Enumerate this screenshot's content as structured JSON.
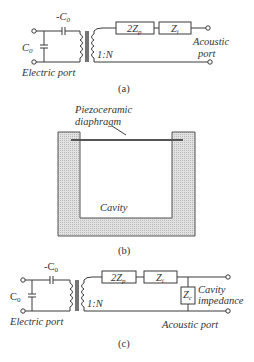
{
  "figure": {
    "panel_a": {
      "caption": "(a)",
      "series_capacitor": "-C",
      "series_capacitor_sub": "0",
      "shunt_capacitor": "C",
      "shunt_capacitor_sub": "0",
      "transformer_ratio": "1:N",
      "impedance_1": "2Z",
      "impedance_1_sub": "p",
      "impedance_2": "Z",
      "impedance_2_sub": "i",
      "electric_port_label": "Electric port",
      "acoustic_port_label_line1": "Acoustic",
      "acoustic_port_label_line2": "port"
    },
    "panel_b": {
      "caption": "(b)",
      "diaphragm_label_line1": "Piezoceramic",
      "diaphragm_label_line2": "diaphragm",
      "cavity_label": "Cavity"
    },
    "panel_c": {
      "caption": "(c)",
      "series_capacitor": "-C",
      "series_capacitor_sub": "0",
      "shunt_capacitor": "C",
      "shunt_capacitor_sub": "0",
      "transformer_ratio": "1:N",
      "impedance_1": "2Z",
      "impedance_1_sub": "p",
      "impedance_2": "Z",
      "impedance_2_sub": "i",
      "cavity_impedance": "Z",
      "cavity_impedance_sub": "c",
      "cavity_impedance_label_line1": "Cavity",
      "cavity_impedance_label_line2": "impedance",
      "electric_port_label": "Electric port",
      "acoustic_port_label": "Acoustic port"
    }
  }
}
